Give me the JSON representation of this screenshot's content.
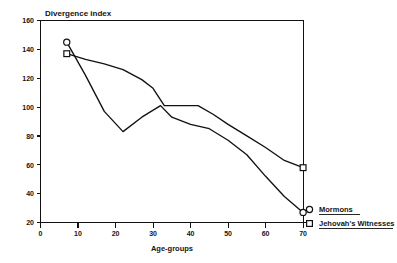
{
  "chart_data": {
    "type": "line",
    "title": "Divergence index",
    "xlabel": "Age-groups",
    "ylabel": "Divergence index",
    "xlim": [
      0,
      72
    ],
    "ylim": [
      20,
      160
    ],
    "xticks": [
      0,
      10,
      20,
      30,
      40,
      50,
      60,
      70
    ],
    "yticks": [
      20,
      40,
      60,
      80,
      100,
      120,
      140,
      160
    ],
    "grid": false,
    "legend_position": "bottom-right-outside",
    "series": [
      {
        "name": "Mormons",
        "marker": "circle-open",
        "marker_at": [
          7,
          70
        ],
        "x": [
          7,
          12,
          17,
          22,
          27,
          32,
          35,
          40,
          45,
          50,
          55,
          60,
          65,
          70
        ],
        "y": [
          145,
          122,
          97,
          83,
          93,
          101,
          93,
          88,
          85,
          77,
          67,
          52,
          38,
          27
        ]
      },
      {
        "name": "Jehovah's Witnesses",
        "marker": "square-open",
        "marker_at": [
          7,
          70
        ],
        "x": [
          7,
          12,
          17,
          22,
          27,
          30,
          33,
          38,
          42,
          46,
          50,
          55,
          60,
          65,
          70
        ],
        "y": [
          137,
          133,
          130,
          126,
          119,
          113,
          101,
          101,
          101,
          95,
          88,
          80,
          72,
          63,
          58
        ]
      }
    ]
  },
  "legend": {
    "items": [
      {
        "label": "Mormons",
        "marker": "circle-open"
      },
      {
        "label": "Jehovah's Witnesses",
        "marker": "square-open"
      }
    ]
  },
  "axes": {
    "y_tick_labels": [
      "160",
      "140",
      "120",
      "100",
      "80",
      "60",
      "40",
      "20"
    ],
    "x_tick_labels": [
      "0",
      "10",
      "20",
      "30",
      "40",
      "50",
      "60",
      "70"
    ],
    "x_axis_title": "Age-groups",
    "y_axis_title": "Divergence index"
  },
  "colors": {
    "ink": "#111111",
    "paper": "#ffffff"
  }
}
